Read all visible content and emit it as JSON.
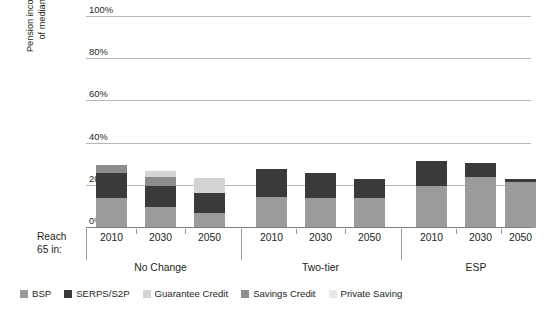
{
  "chart_data": {
    "type": "bar",
    "title": "",
    "subtitle": "",
    "xlabel": "Reach 65 in:",
    "ylabel": "Pension income as percentage\nof median earnings at 75",
    "ylim": [
      0,
      100
    ],
    "ytick_labels": [
      "0%",
      "20%",
      "40%",
      "60%",
      "80%",
      "100%"
    ],
    "ytick_values": [
      0,
      20,
      40,
      60,
      80,
      100
    ],
    "grid": true,
    "stacked": true,
    "legend_position": "bottom",
    "groups": [
      "No Change",
      "Two-tier",
      "ESP"
    ],
    "categories": [
      "2010",
      "2030",
      "2050",
      "2010",
      "2030",
      "2050",
      "2010",
      "2030",
      "2050"
    ],
    "series": [
      {
        "name": "BSP",
        "color": "#9b9b9b",
        "values": [
          14,
          10,
          7,
          14.5,
          14,
          14,
          20,
          24,
          22
        ]
      },
      {
        "name": "SERPS/S2P",
        "color": "#3a3a3a",
        "values": [
          12,
          10,
          9.5,
          13.5,
          12,
          9,
          12,
          7,
          1
        ]
      },
      {
        "name": "Guarantee Credit",
        "color": "#d4d4d4",
        "values": [
          0,
          3,
          7,
          0,
          0,
          0,
          0,
          0,
          0
        ]
      },
      {
        "name": "Savings Credit",
        "color": "#8c8c8c",
        "values": [
          4,
          4,
          0,
          0,
          0,
          0,
          0,
          0,
          0
        ]
      },
      {
        "name": "Private Saving",
        "color": "#e4e4e4",
        "values": [
          0,
          0,
          0,
          0,
          0,
          0,
          0,
          0,
          0
        ]
      }
    ],
    "bar_totals": [
      30,
      27,
      23.5,
      28,
      26,
      23,
      32,
      31,
      23
    ],
    "colors": {
      "gridline": "#b7b7b7",
      "axis": "#808080",
      "text": "#231f20",
      "background": "#ffffff"
    }
  },
  "legend": {
    "items": [
      {
        "label": "BSP",
        "color": "#9b9b9b"
      },
      {
        "label": "SERPS/S2P",
        "color": "#3a3a3a"
      },
      {
        "label": "Guarantee Credit",
        "color": "#d4d4d4"
      },
      {
        "label": "Savings Credit",
        "color": "#8c8c8c"
      },
      {
        "label": "Private Saving",
        "color": "#e7e7e7"
      }
    ]
  },
  "axis": {
    "reach_label": "Reach\n65 in:",
    "y_title": "Pension income as percentage\nof median earnings at 75",
    "ticks": [
      {
        "label": "100%",
        "value": 100
      },
      {
        "label": "80%",
        "value": 80
      },
      {
        "label": "60%",
        "value": 60
      },
      {
        "label": "40%",
        "value": 40
      },
      {
        "label": "20%",
        "value": 20
      },
      {
        "label": "0%",
        "value": 0
      }
    ]
  },
  "groups": [
    {
      "label": "No Change",
      "years": [
        "2010",
        "2030",
        "2050"
      ]
    },
    {
      "label": "Two-tier",
      "years": [
        "2010",
        "2030",
        "2050"
      ]
    },
    {
      "label": "ESP",
      "years": [
        "2010",
        "2030",
        "2050"
      ]
    }
  ]
}
